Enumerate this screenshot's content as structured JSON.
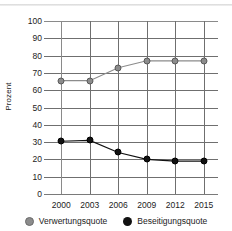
{
  "chart_data": {
    "type": "line",
    "title": "",
    "xlabel": "",
    "ylabel": "Prozent",
    "categories": [
      "2000",
      "2003",
      "2006",
      "2009",
      "2012",
      "2015"
    ],
    "ylim": [
      0,
      100
    ],
    "yticks": [
      "0",
      "10",
      "20",
      "30",
      "40",
      "50",
      "60",
      "70",
      "80",
      "90",
      "100"
    ],
    "grid": true,
    "legend_position": "bottom",
    "series": [
      {
        "name": "Verwertungsquote",
        "color": "#8c8c8c",
        "values": [
          65.5,
          65.5,
          73,
          77,
          77,
          77
        ]
      },
      {
        "name": "Beseitigungsquote",
        "color": "#111111",
        "values": [
          30.5,
          31,
          24,
          20,
          19,
          19
        ]
      }
    ]
  },
  "legend": {
    "items": [
      {
        "label": "Verwertungsquote",
        "marker": "circle-gray-icon"
      },
      {
        "label": "Beseitigungsquote",
        "marker": "circle-black-icon"
      }
    ]
  }
}
